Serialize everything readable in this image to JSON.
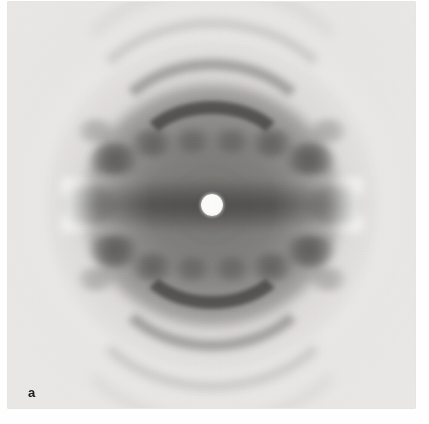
{
  "figure": {
    "panel_label": "a",
    "caption": "",
    "plate_kind": "x-ray-fiber-diffraction-photograph",
    "page_background": "#fefefe"
  },
  "photo": {
    "alt_description": "Black and white X-ray fiber diffraction photograph showing concentric dark arcs and a central white beam-stop shadow",
    "base_tone": "#ecebe9",
    "darkest_tone": "#3a3937",
    "beam_stop_color": "#ffffff"
  },
  "chart_data": {
    "type": "heatmap",
    "title": "",
    "subtitle": "",
    "xlabel": "",
    "ylabel": "",
    "grid": false,
    "legend": "none",
    "center": {
      "x": 232,
      "y": 205
    },
    "beam_stop_radius_px": 11,
    "features": [
      {
        "name": "equatorial-band",
        "orientation": "horizontal",
        "offset_y": 0,
        "intensity": 0.95,
        "half_width_px": 27
      },
      {
        "name": "layer-line-1-upper",
        "offset_y": -41,
        "intensity": 0.88
      },
      {
        "name": "layer-line-1-lower",
        "offset_y": 41,
        "intensity": 0.88
      },
      {
        "name": "layer-line-2-upper",
        "offset_y": -76,
        "intensity": 0.55
      },
      {
        "name": "layer-line-2-lower",
        "offset_y": 76,
        "intensity": 0.55
      },
      {
        "name": "layer-line-3-upper",
        "offset_y": -112,
        "intensity": 0.32
      },
      {
        "name": "layer-line-3-lower",
        "offset_y": 112,
        "intensity": 0.32
      },
      {
        "name": "layer-line-4-upper",
        "offset_y": -146,
        "intensity": 0.2
      },
      {
        "name": "layer-line-4-lower",
        "offset_y": 146,
        "intensity": 0.2
      }
    ],
    "spots": [
      {
        "dx": -98,
        "dy": -46,
        "r": 26,
        "a": 0.8
      },
      {
        "dx": 98,
        "dy": -46,
        "r": 26,
        "a": 0.8
      },
      {
        "dx": -98,
        "dy": 46,
        "r": 26,
        "a": 0.8
      },
      {
        "dx": 98,
        "dy": 46,
        "r": 26,
        "a": 0.8
      },
      {
        "dx": -60,
        "dy": -62,
        "r": 22,
        "a": 0.62
      },
      {
        "dx": 60,
        "dy": -62,
        "r": 22,
        "a": 0.62
      },
      {
        "dx": -60,
        "dy": 62,
        "r": 22,
        "a": 0.62
      },
      {
        "dx": 60,
        "dy": 62,
        "r": 22,
        "a": 0.62
      },
      {
        "dx": -122,
        "dy": 0,
        "r": 30,
        "a": 0.72
      },
      {
        "dx": 122,
        "dy": 0,
        "r": 30,
        "a": 0.72
      },
      {
        "dx": -20,
        "dy": -64,
        "r": 20,
        "a": 0.46
      },
      {
        "dx": 20,
        "dy": -64,
        "r": 20,
        "a": 0.46
      },
      {
        "dx": -20,
        "dy": 64,
        "r": 20,
        "a": 0.46
      },
      {
        "dx": 20,
        "dy": 64,
        "r": 20,
        "a": 0.46
      },
      {
        "dx": -116,
        "dy": -74,
        "r": 20,
        "a": 0.38
      },
      {
        "dx": 116,
        "dy": -74,
        "r": 20,
        "a": 0.38
      },
      {
        "dx": -116,
        "dy": 74,
        "r": 20,
        "a": 0.38
      },
      {
        "dx": 116,
        "dy": 74,
        "r": 20,
        "a": 0.38
      }
    ]
  }
}
